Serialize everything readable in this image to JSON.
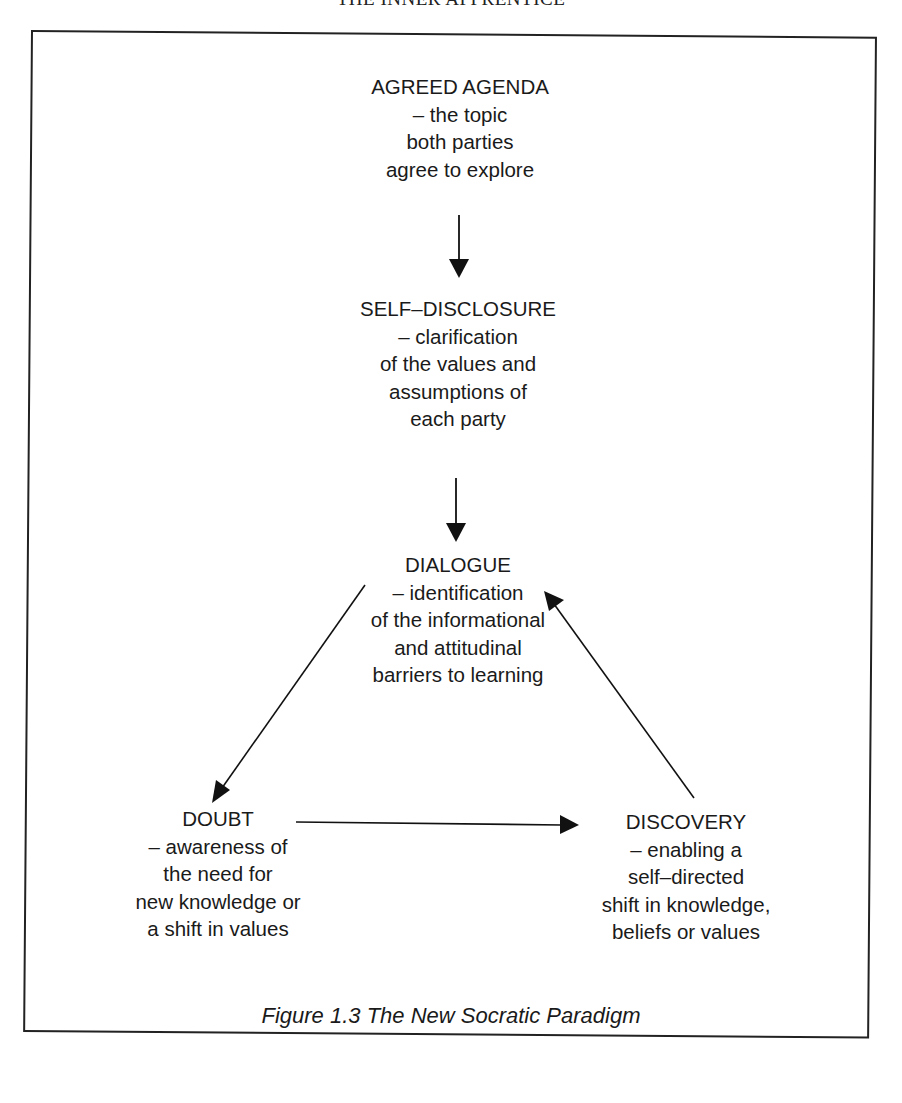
{
  "page": {
    "running_head": "THE INNER APPRENTICE"
  },
  "figure": {
    "caption": "Figure 1.3 The New Socratic Paradigm",
    "nodes": {
      "agreed_agenda": {
        "title": "AGREED AGENDA",
        "lines": [
          "– the topic",
          "both parties",
          "agree to explore"
        ]
      },
      "self_disclosure": {
        "title": "SELF–DISCLOSURE",
        "lines": [
          "– clarification",
          "of the values and",
          "assumptions of",
          "each party"
        ]
      },
      "dialogue": {
        "title": "DIALOGUE",
        "lines": [
          "– identification",
          "of the informational",
          "and attitudinal",
          "barriers to learning"
        ]
      },
      "doubt": {
        "title": "DOUBT",
        "lines": [
          "– awareness of",
          "the need for",
          "new knowledge or",
          "a shift in values"
        ]
      },
      "discovery": {
        "title": "DISCOVERY",
        "lines": [
          "– enabling a",
          "self–directed",
          "shift in knowledge,",
          "beliefs or values"
        ]
      }
    },
    "edges": [
      {
        "from": "AGREED AGENDA",
        "to": "SELF–DISCLOSURE"
      },
      {
        "from": "SELF–DISCLOSURE",
        "to": "DIALOGUE"
      },
      {
        "from": "DIALOGUE",
        "to": "DOUBT"
      },
      {
        "from": "DOUBT",
        "to": "DISCOVERY"
      },
      {
        "from": "DISCOVERY",
        "to": "DIALOGUE"
      }
    ]
  }
}
